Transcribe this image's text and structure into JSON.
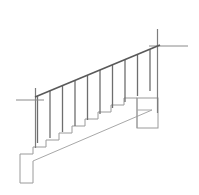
{
  "figure": {
    "background_color": "#ffffff",
    "canvas": {
      "width": 199,
      "height": 195
    }
  },
  "styles": {
    "handrail_color": "#595959",
    "handrail_width": 1.6,
    "baluster_color": "#6e6e6e",
    "baluster_width": 1.3,
    "newel_color": "#7d7d7d",
    "newel_width": 1.2,
    "step_color": "#9a9a9a",
    "step_width": 1.0,
    "stringer_color": "#a8a8a8",
    "stringer_width": 1.0,
    "block_color": "#9a9a9a",
    "block_width": 1.0,
    "crossbar_color": "#8a8a8a",
    "crossbar_width": 1.0
  },
  "parts": {
    "handrail": {
      "label": "handrail",
      "x1": 35,
      "y1": 97,
      "x2": 160,
      "y2": 45
    },
    "stringer": {
      "label": "stringer",
      "x1": 33,
      "y1": 161,
      "x2": 152,
      "y2": 110
    },
    "balusters": {
      "label": "balusters",
      "count": 10,
      "lines": [
        {
          "x": 37.5,
          "y_top": 96.0,
          "y_bottom": 143.0
        },
        {
          "x": 50.0,
          "y_top": 90.8,
          "y_bottom": 138.0
        },
        {
          "x": 62.5,
          "y_top": 85.6,
          "y_bottom": 132.0
        },
        {
          "x": 75.0,
          "y_top": 80.4,
          "y_bottom": 126.0
        },
        {
          "x": 87.5,
          "y_top": 75.2,
          "y_bottom": 120.0
        },
        {
          "x": 100.0,
          "y_top": 70.0,
          "y_bottom": 114.0
        },
        {
          "x": 112.5,
          "y_top": 64.8,
          "y_bottom": 108.0
        },
        {
          "x": 125.0,
          "y_top": 59.6,
          "y_bottom": 102.0
        },
        {
          "x": 137.5,
          "y_top": 54.4,
          "y_bottom": 96.0
        },
        {
          "x": 150.0,
          "y_top": 49.2,
          "y_bottom": 91.0
        }
      ]
    },
    "newel_bottom": {
      "label": "bottom-newel-post",
      "x": 35.5,
      "y_top": 88.0,
      "y_bottom": 148.0,
      "crossbar": {
        "x1": 16.0,
        "y1": 100.0,
        "x2": 44.0,
        "y2": 100.0
      }
    },
    "newel_top": {
      "label": "top-newel-post",
      "x": 157.5,
      "y_top": 29.0,
      "y_bottom": 113.0,
      "crossbar": {
        "x1": 149.0,
        "y1": 46.0,
        "x2": 188.0,
        "y2": 46.0
      }
    },
    "steps": {
      "label": "step-profile",
      "riser_height": 7.2,
      "tread_depth": 13.0,
      "count": 9,
      "polyline": "20,183 20,154 33,154 33,147 46,147 46,140 59,140 59,133 72,133 72,126 85,126 85,119 98,119 98,112 111,112 111,105 124,105 124,98 137,98"
    },
    "top_block": {
      "label": "top-landing-block",
      "x": 137,
      "y": 98,
      "width": 21,
      "height": 30
    },
    "bottom_block": {
      "label": "bottom-starting-block",
      "x": 20,
      "y": 154,
      "width": 13,
      "height": 29
    }
  }
}
